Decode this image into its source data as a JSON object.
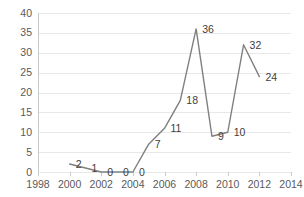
{
  "chart_data": {
    "type": "line",
    "title": "",
    "subtitle": "",
    "xlabel": "",
    "ylabel": "",
    "xlim": [
      1998,
      2014
    ],
    "ylim": [
      0,
      40
    ],
    "x_ticks": [
      1998,
      2000,
      2002,
      2004,
      2006,
      2008,
      2010,
      2012,
      2014
    ],
    "y_ticks": [
      0,
      5,
      10,
      15,
      20,
      25,
      30,
      35,
      40
    ],
    "x_tick_labels": [
      "1998",
      "2000",
      "2002",
      "2004",
      "2006",
      "2008",
      "2010",
      "2012",
      "2014"
    ],
    "y_tick_labels": [
      "0",
      "5",
      "10",
      "15",
      "20",
      "25",
      "30",
      "35",
      "40"
    ],
    "grid": "horizontal",
    "legend": "none",
    "series": [
      {
        "name": "series-1",
        "color": "#808080",
        "x": [
          2000,
          2001,
          2002,
          2003,
          2004,
          2005,
          2006,
          2007,
          2008,
          2009,
          2010,
          2011,
          2012
        ],
        "values": [
          2,
          1,
          0,
          0,
          0,
          7,
          11,
          18,
          36,
          9,
          10,
          32,
          24
        ]
      }
    ],
    "data_labels": [
      {
        "x": 2000,
        "y": 2,
        "text": "2"
      },
      {
        "x": 2001,
        "y": 1,
        "text": "1"
      },
      {
        "x": 2002,
        "y": 0,
        "text": "0"
      },
      {
        "x": 2003,
        "y": 0,
        "text": "0"
      },
      {
        "x": 2004,
        "y": 0,
        "text": "0"
      },
      {
        "x": 2005,
        "y": 7,
        "text": "7"
      },
      {
        "x": 2006,
        "y": 11,
        "text": "11"
      },
      {
        "x": 2007,
        "y": 18,
        "text": "18"
      },
      {
        "x": 2008,
        "y": 36,
        "text": "36"
      },
      {
        "x": 2009,
        "y": 9,
        "text": "9"
      },
      {
        "x": 2010,
        "y": 10,
        "text": "10"
      },
      {
        "x": 2011,
        "y": 32,
        "text": "32"
      },
      {
        "x": 2012,
        "y": 24,
        "text": "24"
      }
    ],
    "colors": {
      "line": "#808080",
      "grid": "#e8e8e8",
      "axis": "#c9c9c9",
      "tick_text": "#5a5a5a",
      "label_text": "#404040",
      "background": "#ffffff"
    }
  }
}
